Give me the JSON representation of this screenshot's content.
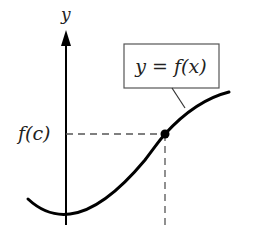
{
  "diagram": {
    "type": "function-graph",
    "axis_label_y": "y",
    "function_label": "y = f(x)",
    "point_label": "f(c)",
    "colors": {
      "curve": "#000000",
      "axis": "#000000",
      "dashed": "#555555",
      "box_border": "#555555",
      "text": "#222222"
    },
    "point": {
      "name": "c",
      "x": 165,
      "y": 134
    }
  }
}
